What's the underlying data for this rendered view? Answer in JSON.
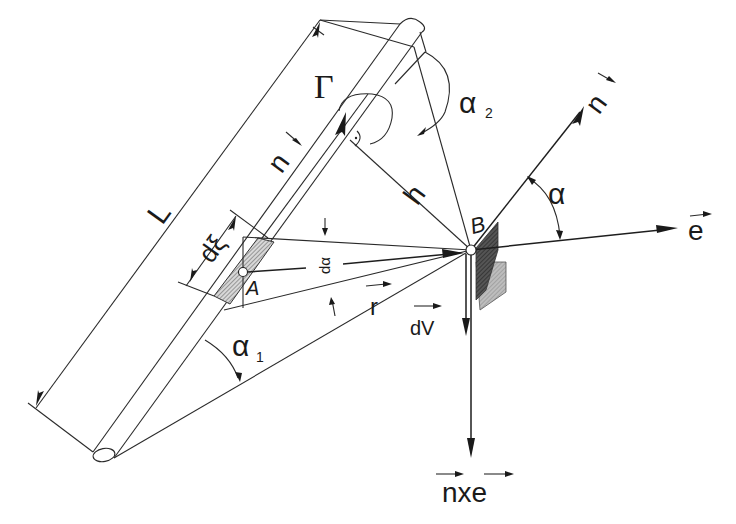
{
  "figure": {
    "colors": {
      "background": "#ffffff",
      "ink": "#1a1a1a",
      "hatch_dark": "#3a3a3a",
      "hatch_light": "#9a9a9a"
    }
  },
  "labels": {
    "gamma": "Γ",
    "alpha2": "α",
    "alpha2_sub": "2",
    "n_vec_left": "n",
    "n_vec_right": "n",
    "h": "h",
    "B": "B",
    "alpha": "α",
    "e": "e",
    "L": "L",
    "dxi": "dξ",
    "A": "A",
    "dalpha": "dα",
    "r": "r",
    "dV": "dV",
    "alpha1": "α",
    "alpha1_sub": "1",
    "nxe": "nxe"
  },
  "points": {
    "A": {
      "x": 243,
      "y": 272
    },
    "B": {
      "x": 471,
      "y": 250
    },
    "rod_bottom": {
      "x": 104,
      "y": 455
    },
    "rod_top": {
      "x": 412,
      "y": 30
    }
  }
}
